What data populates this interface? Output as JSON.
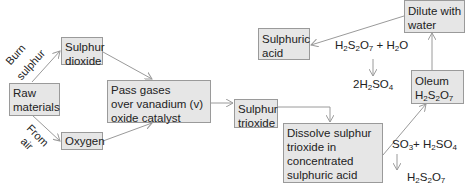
{
  "boxes": {
    "raw_materials": [
      "Raw",
      "materials"
    ],
    "sulphur_dioxide": [
      "Sulphur",
      "dioxide"
    ],
    "oxygen": [
      "Oxygen"
    ],
    "pass_gases": [
      "Pass gases",
      "over vanadium (v)",
      "oxide catalyst"
    ],
    "sulphur_trioxide": [
      "Sulphur",
      "trioxide"
    ],
    "dissolve": [
      "Dissolve sulphur",
      "trioxide in",
      "concentrated",
      "sulphuric acid"
    ],
    "oleum": {
      "line1": "Oleum",
      "formula": {
        "H": "H",
        "s2": "2",
        "S": "S",
        "s3": "2",
        "O": "O",
        "s4": "7"
      }
    },
    "dilute": [
      "Dilute with",
      "water"
    ],
    "sulphuric_acid": [
      "Sulphuric",
      "acid"
    ]
  },
  "labels": {
    "burn": [
      "Burn",
      "sulphur"
    ],
    "from": [
      "From",
      "air"
    ]
  },
  "equations": {
    "dilute_reactants": {
      "a": "H",
      "a2": "2",
      "b": "S",
      "b2": "2",
      "c": "O",
      "c2": "7",
      "plus": " + H",
      "d2": "2",
      "e": "O"
    },
    "dilute_product": {
      "a": "2H",
      "a2": "2",
      "b": "SO",
      "b2": "4"
    },
    "dissolve_reactants": {
      "a": "SO",
      "a2": "3",
      "plus": "+ H",
      "b2": "2",
      "c": "SO",
      "c2": "4"
    },
    "dissolve_product": {
      "a": "H",
      "a2": "2",
      "b": "S",
      "b2": "2",
      "c": "O",
      "c2": "7"
    }
  },
  "colors": {
    "box_fill": "#e6e6e6",
    "box_border": "#9a9a9a",
    "arrow": "#9a9a9a"
  }
}
